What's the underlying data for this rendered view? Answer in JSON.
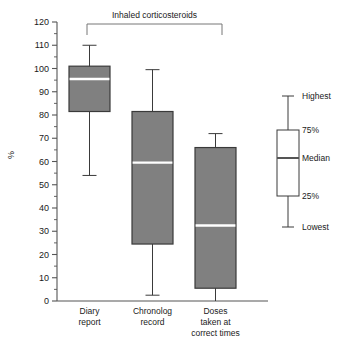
{
  "chart_data": {
    "type": "box",
    "title": "",
    "xlabel": "",
    "ylabel": "%",
    "ylim": [
      0,
      120
    ],
    "ytick_step": 10,
    "yminor_step": 5,
    "grid": false,
    "annotation": {
      "text": "Inhaled corticosteroids",
      "spans_categories": [
        "Diary report",
        "Chronolog record"
      ]
    },
    "categories": [
      "Diary report",
      "Chronolog record",
      "Doses taken at correct times"
    ],
    "category_lines": [
      [
        "Diary",
        "report"
      ],
      [
        "Chronolog",
        "record"
      ],
      [
        "Doses",
        "taken at",
        "correct times"
      ]
    ],
    "ytick_labels": [
      "0",
      "10",
      "20",
      "30",
      "40",
      "50",
      "60",
      "70",
      "80",
      "90",
      "100",
      "110",
      "120"
    ],
    "boxes": [
      {
        "category": "Diary report",
        "lowest": 54,
        "q1": 81.5,
        "median": 95.5,
        "q3": 101,
        "highest": 110
      },
      {
        "category": "Chronolog record",
        "lowest": 2.5,
        "q1": 24.5,
        "median": 59.5,
        "q3": 81.5,
        "highest": 99.5
      },
      {
        "category": "Doses taken at correct times",
        "lowest": 0,
        "q1": 5.5,
        "median": 32.5,
        "q3": 66,
        "highest": 72
      }
    ],
    "colors": {
      "box_fill": "#808080",
      "box_stroke": "#3a3a3a",
      "median_line": "#ffffff",
      "whisker": "#3a3a3a",
      "axis": "#555555",
      "text": "#1a1a1a",
      "legend_fill": "#ffffff",
      "legend_stroke": "#3a3a3a",
      "legend_median": "#555555"
    },
    "legend": {
      "position": "right",
      "entries": [
        {
          "key": "highest",
          "label": "Highest"
        },
        {
          "key": "q3",
          "label": "75%"
        },
        {
          "key": "median",
          "label": "Median"
        },
        {
          "key": "q1",
          "label": "25%"
        },
        {
          "key": "lowest",
          "label": "Lowest"
        }
      ]
    }
  }
}
